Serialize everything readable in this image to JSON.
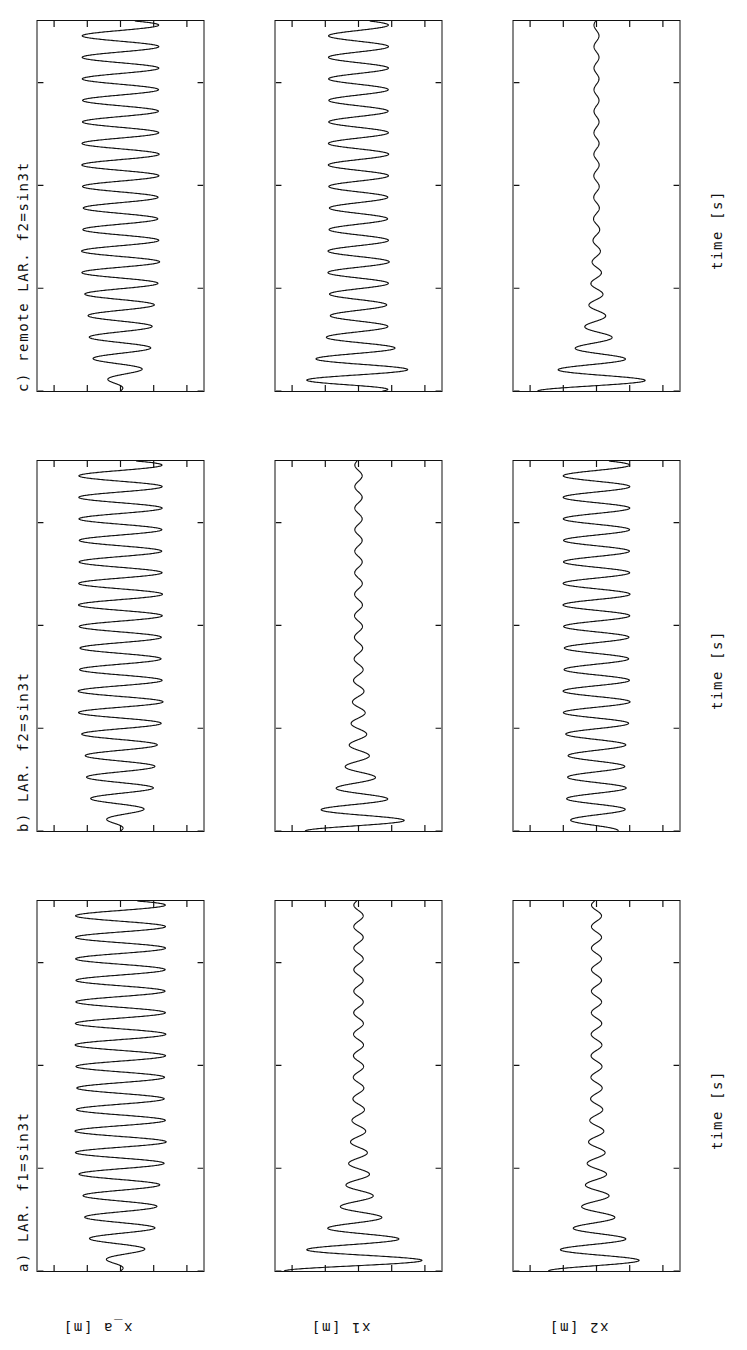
{
  "figure": {
    "orientation": "rotated-90-ccw",
    "background": "#ffffff",
    "line_color": "#111111",
    "columns": [
      {
        "id": "a",
        "title": "a) LAR. f1=sin3t"
      },
      {
        "id": "b",
        "title": "b) LAR. f2=sin3t"
      },
      {
        "id": "c",
        "title": "c) remote LAR. f2=sin3t"
      }
    ],
    "rows": [
      {
        "id": "x_a",
        "ylabel": "x_a [m]"
      },
      {
        "id": "x1",
        "ylabel": "x1 [m]"
      },
      {
        "id": "x2",
        "ylabel": "x2 [m]"
      }
    ],
    "xlabel": "time [s]",
    "xticks": [
      "0",
      "10",
      "20",
      "30"
    ],
    "yticks_big": [
      "0.2",
      "0.1",
      "0",
      "-0.1",
      "-0.2"
    ],
    "yticks_small": [
      "0.04",
      "0.02",
      "0",
      "-0.02",
      "-0.04"
    ]
  },
  "chart_data": [
    {
      "type": "line",
      "panel": "a-x_a",
      "title": "a) LAR. f1=sin3t",
      "xlabel": "time [s]",
      "ylabel": "x_a [m]",
      "xlim": [
        0,
        36
      ],
      "ylim": [
        -0.25,
        0.25
      ],
      "xticks": [
        0,
        10,
        20,
        30
      ],
      "yticks": [
        0.2,
        0.1,
        0,
        -0.1,
        -0.2
      ],
      "grid": false,
      "legend": "none",
      "waveform": {
        "model": "ramped_sine",
        "omega": 3.0,
        "phase_deg": -90,
        "envelope": "A(t) = A_inf * (1 - exp(-t/tau))",
        "A_inf": 0.135,
        "tau": 3.2,
        "note": "starts at 0, grows within ~8 s to a steady +/-0.135 m oscillation"
      }
    },
    {
      "type": "line",
      "panel": "a-x1",
      "title": "a) LAR. f1=sin3t",
      "xlabel": "time [s]",
      "ylabel": "x1 [m]",
      "xlim": [
        0,
        36
      ],
      "ylim": [
        -0.05,
        0.05
      ],
      "xticks": [
        0,
        10,
        20,
        30
      ],
      "yticks": [
        0.04,
        0.02,
        0,
        -0.02,
        -0.04
      ],
      "grid": false,
      "legend": "none",
      "waveform": {
        "model": "decaying_sine",
        "omega": 3.0,
        "phase_deg": 90,
        "envelope": "A(t) = A0 * exp(-t/tau) + A_inf",
        "A0": 0.042,
        "tau": 4.0,
        "A_inf": 0.0028,
        "note": "large initial transient +/-0.042 m decaying to ~+/-0.003 m residual"
      }
    },
    {
      "type": "line",
      "panel": "a-x2",
      "title": "a) LAR. f1=sin3t",
      "xlabel": "time [s]",
      "ylabel": "x2 [m]",
      "xlim": [
        0,
        36
      ],
      "ylim": [
        -0.05,
        0.05
      ],
      "xticks": [
        0,
        10,
        20,
        30
      ],
      "yticks": [
        0.04,
        0.02,
        0,
        -0.02,
        -0.04
      ],
      "grid": false,
      "legend": "none",
      "waveform": {
        "model": "decaying_sine",
        "omega": 3.0,
        "phase_deg": 90,
        "envelope": "A(t) = A0 * exp(-t/tau) + A_inf",
        "A0": 0.026,
        "tau": 4.5,
        "A_inf": 0.003,
        "note": "transient +/-0.026 m decaying to ~+/-0.003 m residual"
      }
    },
    {
      "type": "line",
      "panel": "b-x_a",
      "title": "b) LAR. f2=sin3t",
      "xlabel": "time [s]",
      "ylabel": "x_a [m]",
      "xlim": [
        0,
        36
      ],
      "ylim": [
        -0.25,
        0.25
      ],
      "xticks": [
        0,
        10,
        20,
        30
      ],
      "yticks": [
        0.2,
        0.1,
        0,
        -0.1,
        -0.2
      ],
      "grid": false,
      "legend": "none",
      "waveform": {
        "model": "ramped_sine",
        "omega": 3.0,
        "phase_deg": -90,
        "envelope": "A(t) = A_inf * (1 - exp(-t/tau))",
        "A_inf": 0.125,
        "tau": 3.0,
        "note": "same ramp-up shape as panel a, steady +/-0.125 m"
      }
    },
    {
      "type": "line",
      "panel": "b-x1",
      "title": "b) LAR. f2=sin3t",
      "xlabel": "time [s]",
      "ylabel": "x1 [m]",
      "xlim": [
        0,
        36
      ],
      "ylim": [
        -0.05,
        0.05
      ],
      "xticks": [
        0,
        10,
        20,
        30
      ],
      "yticks": [
        0.04,
        0.02,
        0,
        -0.02,
        -0.04
      ],
      "grid": false,
      "legend": "none",
      "waveform": {
        "model": "decaying_sine",
        "omega": 3.0,
        "phase_deg": 90,
        "envelope": "A(t) = A0 * exp(-t/tau) + A_inf",
        "A0": 0.03,
        "tau": 4.0,
        "A_inf": 0.0022,
        "note": "transient +/-0.030 m decaying to near-flat ~+/-0.002 m"
      }
    },
    {
      "type": "line",
      "panel": "b-x2",
      "title": "b) LAR. f2=sin3t",
      "xlabel": "time [s]",
      "ylabel": "x2 [m]",
      "xlim": [
        0,
        36
      ],
      "ylim": [
        -0.05,
        0.05
      ],
      "xticks": [
        0,
        10,
        20,
        30
      ],
      "yticks": [
        0.04,
        0.02,
        0,
        -0.02,
        -0.04
      ],
      "grid": false,
      "legend": "none",
      "waveform": {
        "model": "ramped_sine",
        "omega": 3.0,
        "phase_deg": -90,
        "envelope": "A(t) = A_inf * (1 - 0.35*exp(-t/tau))",
        "A_inf": 0.02,
        "tau": 5.0,
        "note": "sustained oscillation, settles near +/-0.020 m"
      }
    },
    {
      "type": "line",
      "panel": "c-x_a",
      "title": "c) remote LAR. f2=sin3t",
      "xlabel": "time [s]",
      "ylabel": "x_a [m]",
      "xlim": [
        0,
        36
      ],
      "ylim": [
        -0.25,
        0.25
      ],
      "xticks": [
        0,
        10,
        20,
        30
      ],
      "yticks": [
        0.2,
        0.1,
        0,
        -0.1,
        -0.2
      ],
      "grid": false,
      "legend": "none",
      "waveform": {
        "model": "ramped_sine",
        "omega": 3.0,
        "phase_deg": -90,
        "envelope": "A(t) = A_inf * (1 - exp(-t/tau))",
        "A_inf": 0.115,
        "tau": 3.0,
        "note": "ramp-up to steady +/-0.115 m"
      }
    },
    {
      "type": "line",
      "panel": "c-x1",
      "title": "c) remote LAR. f2=sin3t",
      "xlabel": "time [s]",
      "ylabel": "x1 [m]",
      "xlim": [
        0,
        36
      ],
      "ylim": [
        -0.05,
        0.05
      ],
      "xticks": [
        0,
        10,
        20,
        30
      ],
      "yticks": [
        0.04,
        0.02,
        0,
        -0.02,
        -0.04
      ],
      "grid": false,
      "legend": "none",
      "waveform": {
        "model": "ramped_sine",
        "omega": 3.0,
        "phase_deg": -90,
        "envelope": "A(t) = A_inf * (1 - 0.2*exp(-t/tau)) with early overshoot ~0.030",
        "A_inf": 0.018,
        "tau": 5.0,
        "note": "early transient up to ~0.030 m then sustained +/-0.018 m"
      }
    },
    {
      "type": "line",
      "panel": "c-x2",
      "title": "c) remote LAR. f2=sin3t",
      "xlabel": "time [s]",
      "ylabel": "x2 [m]",
      "xlim": [
        0,
        36
      ],
      "ylim": [
        -0.05,
        0.05
      ],
      "xticks": [
        0,
        10,
        20,
        30
      ],
      "yticks": [
        0.04,
        0.02,
        0,
        -0.02,
        -0.04
      ],
      "grid": false,
      "legend": "none",
      "waveform": {
        "model": "decaying_sine",
        "omega": 3.0,
        "phase_deg": 90,
        "envelope": "A(t) = A0 * exp(-t/tau) + A_inf",
        "A0": 0.034,
        "tau": 3.6,
        "A_inf": 0.0015,
        "note": "strongly damped, essentially flat after ~18 s"
      }
    }
  ]
}
